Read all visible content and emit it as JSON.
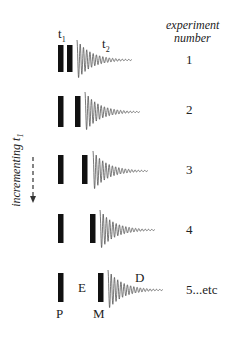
{
  "header": {
    "column_title_line1": "experiment",
    "column_title_line2": "number"
  },
  "side_label": {
    "text": "incrementing t",
    "subscript": "1"
  },
  "top_labels": {
    "t1": "t",
    "t1_sub": "1",
    "t2": "t",
    "t2_sub": "2"
  },
  "rows": [
    {
      "number": "1",
      "bar1_x": 58,
      "bar2_x": 67,
      "top": 45,
      "height": 27,
      "fid_x": 77,
      "baseline": 60
    },
    {
      "number": "2",
      "bar1_x": 58,
      "bar2_x": 75,
      "top": 96,
      "height": 31,
      "fid_x": 85,
      "baseline": 112
    },
    {
      "number": "3",
      "bar1_x": 58,
      "bar2_x": 82,
      "top": 155,
      "height": 29,
      "fid_x": 93,
      "baseline": 171
    },
    {
      "number": "4",
      "bar1_x": 58,
      "bar2_x": 90,
      "top": 214,
      "height": 29,
      "fid_x": 100,
      "baseline": 230
    },
    {
      "number": "5...etc",
      "bar1_x": 58,
      "bar2_x": 98,
      "top": 273,
      "height": 29,
      "fid_x": 108,
      "baseline": 290
    }
  ],
  "period_labels": {
    "P": "P",
    "E": "E",
    "M": "M",
    "D": "D"
  },
  "colors": {
    "pulse": "#111111",
    "fid": "#555555",
    "text": "#222222"
  }
}
